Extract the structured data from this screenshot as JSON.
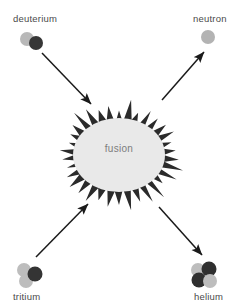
{
  "diagram": {
    "title": "fusion",
    "width": 238,
    "height": 308,
    "background": "#ffffff"
  },
  "labels": {
    "deuterium": "deuterium",
    "neutron": "neutron",
    "tritium": "tritium",
    "helium": "helium",
    "fusion": "fusion"
  },
  "colors": {
    "background": "#ffffff",
    "label_text": "#4a4a4a",
    "fusion_text": "#7d7d7d",
    "burst_fill": "#e9e9e9",
    "burst_spike": "#2b2b2b",
    "arrow": "#1a1a1a",
    "proton": "#3a3a3a",
    "neutron_particle": "#b3b3b3"
  },
  "particles": {
    "deuterium": {
      "label": "deuterium",
      "nucleon_count": 2,
      "nucleons": [
        {
          "type": "neutron",
          "cx": 27,
          "cy": 39,
          "r": 7,
          "fill": "#b8b8b8"
        },
        {
          "type": "proton",
          "cx": 36,
          "cy": 43,
          "r": 7,
          "fill": "#363636"
        }
      ]
    },
    "neutron": {
      "label": "neutron",
      "nucleon_count": 1,
      "nucleons": [
        {
          "type": "neutron",
          "cx": 208,
          "cy": 37,
          "r": 7,
          "fill": "#b3b3b3"
        }
      ]
    },
    "tritium": {
      "label": "tritium",
      "nucleon_count": 3,
      "nucleons": [
        {
          "type": "neutron",
          "cx": 24,
          "cy": 270,
          "r": 7,
          "fill": "#bdbdbd"
        },
        {
          "type": "neutron",
          "cx": 26,
          "cy": 281,
          "r": 7,
          "fill": "#bdbdbd"
        },
        {
          "type": "proton",
          "cx": 35,
          "cy": 274,
          "r": 7.5,
          "fill": "#343434"
        }
      ]
    },
    "helium": {
      "label": "helium",
      "nucleon_count": 4,
      "nucleons": [
        {
          "type": "neutron",
          "cx": 198,
          "cy": 270,
          "r": 7,
          "fill": "#bdbdbd"
        },
        {
          "type": "proton",
          "cx": 209,
          "cy": 269,
          "r": 7.5,
          "fill": "#2f2f2f"
        },
        {
          "type": "proton",
          "cx": 199,
          "cy": 280,
          "r": 7.5,
          "fill": "#2f2f2f"
        },
        {
          "type": "neutron",
          "cx": 210,
          "cy": 281,
          "r": 7,
          "fill": "#bdbdbd"
        }
      ]
    }
  },
  "arrows": [
    {
      "name": "deuterium-to-fusion",
      "direction": "inbound",
      "x1": 42,
      "y1": 53,
      "x2": 91,
      "y2": 104
    },
    {
      "name": "tritium-to-fusion",
      "direction": "inbound",
      "x1": 36,
      "y1": 257,
      "x2": 88,
      "y2": 204
    },
    {
      "name": "fusion-to-neutron",
      "direction": "outbound",
      "x1": 162,
      "y1": 100,
      "x2": 204,
      "y2": 52
    },
    {
      "name": "fusion-to-helium",
      "direction": "outbound",
      "x1": 159,
      "y1": 207,
      "x2": 202,
      "y2": 255
    }
  ],
  "burst": {
    "name": "fusion-burst",
    "center_x": 119,
    "center_y": 155,
    "outer_rx": 62,
    "outer_ry": 53,
    "inner_rx": 44,
    "inner_ry": 35,
    "spike_count": 34
  }
}
